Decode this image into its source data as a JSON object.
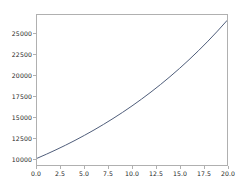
{
  "chart_data": {
    "type": "line",
    "title": "",
    "xlabel": "",
    "ylabel": "",
    "xlim": [
      0,
      20
    ],
    "ylim": [
      9200,
      27200
    ],
    "grid": false,
    "legend": null,
    "line_color": "#4c5a78",
    "x": [
      0,
      1,
      2,
      3,
      4,
      5,
      6,
      7,
      8,
      9,
      10,
      11,
      12,
      13,
      14,
      15,
      16,
      17,
      18,
      19,
      20
    ],
    "y": [
      10000,
      10500,
      11025,
      11576,
      12155,
      12763,
      13401,
      14071,
      14775,
      15513,
      16289,
      17103,
      17959,
      18856,
      19799,
      20789,
      21829,
      22920,
      24066,
      25270,
      26533
    ],
    "xticks": [
      0.0,
      2.5,
      5.0,
      7.5,
      10.0,
      12.5,
      15.0,
      17.5,
      20.0
    ],
    "xtick_labels": [
      "0.0",
      "2.5",
      "5.0",
      "7.5",
      "10.0",
      "12.5",
      "15.0",
      "17.5",
      "20.0"
    ],
    "yticks": [
      10000,
      12500,
      15000,
      17500,
      20000,
      22500,
      25000
    ],
    "ytick_labels": [
      "10000",
      "12500",
      "15000",
      "17500",
      "20000",
      "22500",
      "25000"
    ]
  }
}
